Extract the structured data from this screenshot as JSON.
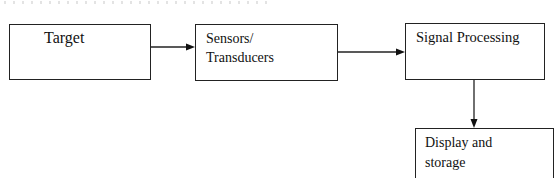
{
  "diagram": {
    "type": "block-diagram",
    "blocks": [
      {
        "id": "target",
        "lines": [
          "Target"
        ]
      },
      {
        "id": "sensors",
        "lines": [
          "Sensors/",
          "Transducers"
        ]
      },
      {
        "id": "signal_processing",
        "lines": [
          "Signal Processing"
        ]
      },
      {
        "id": "display_storage",
        "lines": [
          "Display and",
          "storage"
        ]
      }
    ],
    "edges": [
      {
        "from": "target",
        "to": "sensors",
        "direction": "right"
      },
      {
        "from": "sensors",
        "to": "signal_processing",
        "direction": "right"
      },
      {
        "from": "signal_processing",
        "to": "display_storage",
        "direction": "down"
      }
    ],
    "colors": {
      "stroke": "#222222",
      "text": "#111111",
      "background": "#ffffff"
    }
  }
}
